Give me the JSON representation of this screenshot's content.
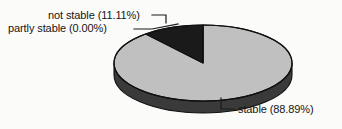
{
  "chart_data": {
    "type": "pie",
    "title": "",
    "subtitle": "",
    "xlabel": "",
    "ylabel": "",
    "grid": false,
    "legend_position": "none",
    "three_d": true,
    "categories": [
      "stable",
      "not stable",
      "partly stable"
    ],
    "values": [
      88.89,
      11.11,
      0.0
    ],
    "value_unit": "%",
    "slices": [
      {
        "label": "stable",
        "value": 88.89,
        "value_text": "88.89%",
        "display_text": "stable (88.89%)",
        "color": "#c0c0c0",
        "side_color": "#3a3a3a",
        "start_angle_deg": 0,
        "end_angle_deg": 320.0
      },
      {
        "label": "not stable",
        "value": 11.11,
        "value_text": "11.11%",
        "display_text": "not stable (11.11%)",
        "color": "#1a1a1a",
        "side_color": "#141414",
        "start_angle_deg": 320.0,
        "end_angle_deg": 360.0
      },
      {
        "label": "partly stable",
        "value": 0.0,
        "value_text": "0.00%",
        "display_text": "partly stable (0.00%)",
        "color": "#7a7a7a",
        "side_color": "#2a2a2a",
        "start_angle_deg": 360.0,
        "end_angle_deg": 360.0
      }
    ],
    "annotations": [
      {
        "text": "not stable (11.11%)",
        "position": "top-left"
      },
      {
        "text": "partly stable (0.00%)",
        "position": "top-left"
      },
      {
        "text": "stable (88.89%)",
        "position": "bottom-right"
      }
    ]
  },
  "labels": {
    "not_stable": "not stable (11.11%)",
    "partly_stable": "partly stable (0.00%)",
    "stable": "stable (88.89%)"
  },
  "colors": {
    "background": "#fbfbfa",
    "slice_stable": "#c0c0c0",
    "slice_not_stable": "#1a1a1a",
    "pie_side_wall": "#3a3a3a",
    "outline": "#101010",
    "leader_line": "#1a1a1a",
    "text": "#151515"
  }
}
